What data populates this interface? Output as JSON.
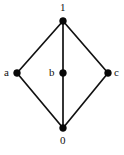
{
  "diagram": {
    "type": "hasse-diagram",
    "title": "",
    "background_color": "#ffffff",
    "node_color": "#080808",
    "edge_color": "#111111",
    "nodes": [
      {
        "id": "top",
        "label": "1",
        "x": 63,
        "y": 21,
        "radius": 3.4,
        "label_x": 60,
        "label_y": 2,
        "label_position": "above"
      },
      {
        "id": "left",
        "label": "a",
        "x": 17,
        "y": 73,
        "radius": 3.4,
        "label_x": 4,
        "label_y": 67,
        "label_position": "left"
      },
      {
        "id": "middle",
        "label": "b",
        "x": 63,
        "y": 73,
        "radius": 3.4,
        "label_x": 49,
        "label_y": 67,
        "label_position": "left"
      },
      {
        "id": "right",
        "label": "c",
        "x": 108,
        "y": 73,
        "radius": 3.4,
        "label_x": 114,
        "label_y": 67,
        "label_position": "right"
      },
      {
        "id": "bottom",
        "label": "0",
        "x": 63,
        "y": 128,
        "radius": 3.4,
        "label_x": 60,
        "label_y": 135,
        "label_position": "below"
      }
    ],
    "edges": [
      {
        "id": "e-top-left",
        "from": "top",
        "to": "left",
        "x1": 63,
        "y1": 21,
        "x2": 17,
        "y2": 73
      },
      {
        "id": "e-top-middle",
        "from": "top",
        "to": "middle",
        "x1": 63,
        "y1": 21,
        "x2": 63,
        "y2": 73
      },
      {
        "id": "e-top-right",
        "from": "top",
        "to": "right",
        "x1": 63,
        "y1": 21,
        "x2": 108,
        "y2": 73
      },
      {
        "id": "e-left-bottom",
        "from": "left",
        "to": "bottom",
        "x1": 17,
        "y1": 73,
        "x2": 63,
        "y2": 128
      },
      {
        "id": "e-middle-bottom",
        "from": "middle",
        "to": "bottom",
        "x1": 63,
        "y1": 73,
        "x2": 63,
        "y2": 128
      },
      {
        "id": "e-right-bottom",
        "from": "right",
        "to": "bottom",
        "x1": 108,
        "y1": 73,
        "x2": 63,
        "y2": 128
      }
    ]
  }
}
